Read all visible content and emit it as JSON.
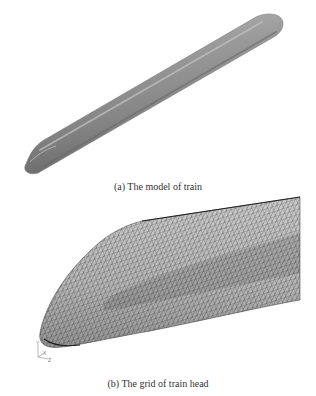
{
  "figure": {
    "subfigures": [
      {
        "id": "a",
        "caption": "(a) The model of train",
        "content": "shaded 3D model of a train body (elongated capsule, diagonal orientation)",
        "colors": {
          "body_light": "#a8a8a8",
          "body_mid": "#8c8c8c",
          "body_dark": "#6e6e6e"
        }
      },
      {
        "id": "b",
        "caption": "(b) The grid of train head",
        "content": "triangular surface mesh of the train nose",
        "axis_triad": {
          "labels": [
            "Y",
            "X",
            "Z"
          ]
        },
        "colors": {
          "mesh_line": "#3a3a3a",
          "mesh_fill": "#c8c8c8"
        }
      }
    ]
  }
}
